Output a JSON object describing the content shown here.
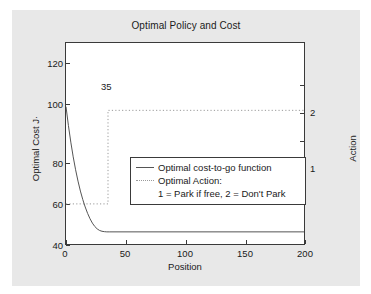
{
  "chart_data": {
    "type": "line",
    "title": "Optimal Policy and Cost",
    "xlabel": "Position",
    "ylabel": "Optimal Cost J·",
    "ylabel_right": "Action",
    "xlim": [
      0,
      200
    ],
    "ylim": [
      28,
      130
    ],
    "ylim_right": [
      0.55,
      2.72
    ],
    "xticks": [
      0,
      50,
      100,
      150,
      200
    ],
    "xticklabels": [
      "0",
      "50",
      "100",
      "150",
      "200"
    ],
    "yticks": [
      40,
      60,
      80,
      100,
      120
    ],
    "yticklabels": [
      "40",
      "60",
      "80",
      "100",
      "120"
    ],
    "yticks_right": [
      1,
      2
    ],
    "yticklabels_right": [
      "1",
      "2"
    ],
    "grid": false,
    "legend_position": "center",
    "annotations": [
      {
        "text": "35",
        "x": 35,
        "y": 112
      }
    ],
    "series": [
      {
        "name": "Optimal cost-to-go function",
        "style": "solid",
        "color": "#555555",
        "x": [
          0,
          2,
          4,
          6,
          8,
          10,
          12,
          14,
          16,
          18,
          20,
          22,
          24,
          26,
          28,
          30,
          32,
          34,
          36,
          40,
          45,
          50,
          60,
          80,
          100,
          120,
          140,
          160,
          180,
          200
        ],
        "y": [
          98.0,
          88.6,
          80.2,
          72.8,
          66.3,
          60.6,
          55.6,
          51.3,
          47.6,
          44.4,
          41.7,
          39.5,
          37.8,
          36.6,
          35.8,
          35.4,
          35.2,
          35.1,
          35.1,
          35.1,
          35.1,
          35.1,
          35.1,
          35.1,
          35.1,
          35.1,
          35.1,
          35.1,
          35.1,
          35.1
        ]
      },
      {
        "name": "Optimal Action",
        "style": "dotted",
        "color": "#9a9a9a",
        "x": [
          0,
          35,
          35,
          200
        ],
        "action": [
          1,
          1,
          2,
          2
        ]
      }
    ],
    "legend_entries": [
      {
        "label": "Optimal cost-to-go function",
        "style": "solid"
      },
      {
        "label": "Optimal Action:",
        "style": "dotted"
      },
      {
        "label": "1 = Park if free, 2 = Don't Park",
        "style": "none"
      }
    ]
  },
  "colors": {
    "figure_background": "#e8e8e8",
    "axes_background": "#ffffff",
    "axis_line": "#3a3a3a",
    "cost_curve": "#555555",
    "action_curve": "#9a9a9a",
    "text": "#1a1a1a"
  }
}
